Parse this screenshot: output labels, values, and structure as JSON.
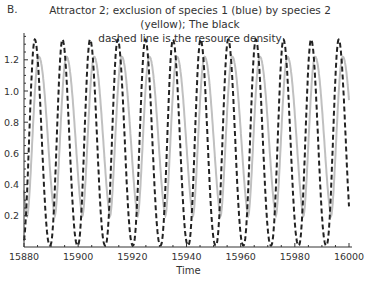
{
  "panel_label": "B.",
  "title_line1": "Attractor 2; exclusion of species 1 (blue) by species 2 (yellow); The black",
  "title_line2": "dashed line is the resource density",
  "chart_data": {
    "type": "line",
    "title": "Attractor 2; exclusion of species 1 (blue) by species 2 (yellow); The black dashed line is the resource density",
    "xlabel": "Time",
    "ylabel": "",
    "xlim": [
      15880,
      16000
    ],
    "ylim": [
      0,
      1.37
    ],
    "xticks": [
      15880,
      15900,
      15920,
      15940,
      15960,
      15980,
      16000
    ],
    "xtick_labels": [
      "15880",
      "15900",
      "15920",
      "15940",
      "15960",
      "15980",
      "16000"
    ],
    "yticks": [
      0.2,
      0.4,
      0.6,
      0.8,
      1.0,
      1.2
    ],
    "ytick_labels": [
      "0.2",
      "0.4",
      "0.6",
      "0.8",
      "1.0",
      "1.2"
    ],
    "grid": false,
    "legend": "none",
    "series": [
      {
        "name": "Species 2 (yellow, rendered light gray)",
        "style": "solid",
        "color": "#c0c0c0",
        "period": 10.2,
        "min": 0.2,
        "max": 1.22,
        "first_peak_time": 15885.5,
        "start_value": 0.18,
        "end_value": 0.32,
        "peak_times": [
          15885.5,
          15895.7,
          15906.0,
          15916.0,
          15926.3,
          15936.3,
          15946.3,
          15956.5,
          15966.5,
          15976.8,
          15987.0,
          15997.2
        ]
      },
      {
        "name": "Resource density",
        "style": "dashed",
        "color": "#222222",
        "period": 10.2,
        "min": 0.01,
        "max": 1.33,
        "first_peak_time": 15884.0,
        "start_value": 0.02,
        "end_value": 0.01,
        "peak_times": [
          15884.0,
          15894.3,
          15904.6,
          15914.6,
          15924.9,
          15934.9,
          15944.8,
          15955.2,
          15965.1,
          15975.4,
          15985.8,
          15996.1
        ]
      }
    ]
  }
}
